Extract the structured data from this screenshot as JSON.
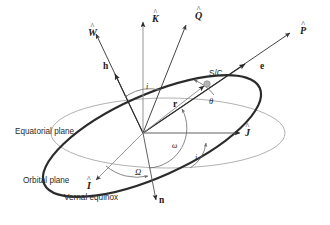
{
  "figure": {
    "colors": {
      "orbit_plane_stroke": "#2b2b2b",
      "equatorial_plane_stroke": "#a8a8a8",
      "vector_stroke": "#3a3a3a",
      "arc_stroke": "#6a6a6a",
      "spacecraft_fill": "#b0b0b0",
      "text": "#2b2b2b",
      "background": "#ffffff"
    }
  },
  "planes": [
    {
      "id": "equatorial-plane",
      "label": "Equatorial plane",
      "style": "thin-light-gray-ellipse"
    },
    {
      "id": "orbital-plane",
      "label": "Orbital plane",
      "style": "thick-dark-ellipse"
    }
  ],
  "labels": {
    "equatorial_plane": "Equatorial plane",
    "orbital_plane": "Orbital plane",
    "vernal_equinox": "Vernal equinox",
    "spacecraft": "S/C"
  },
  "vectors": [
    {
      "id": "W-hat",
      "base": "W",
      "accent": "hat",
      "kind": "unit",
      "description": "orbit normal unit vector"
    },
    {
      "id": "K-hat",
      "base": "K",
      "accent": "hat",
      "kind": "unit",
      "description": "inertial Z unit vector"
    },
    {
      "id": "Q-hat",
      "base": "Q",
      "accent": "hat",
      "kind": "unit",
      "description": "perifocal semi-latus direction"
    },
    {
      "id": "P-hat",
      "base": "P",
      "accent": "hat",
      "kind": "unit",
      "description": "perifocal perigee direction"
    },
    {
      "id": "I-hat",
      "base": "I",
      "accent": "hat",
      "kind": "unit",
      "description": "inertial X unit vector toward vernal equinox"
    },
    {
      "id": "J-hat",
      "base": "J",
      "accent": "hat",
      "kind": "unit",
      "description": "inertial Y unit vector"
    },
    {
      "id": "h",
      "base": "h",
      "accent": "none",
      "kind": "bold",
      "description": "specific angular momentum vector"
    },
    {
      "id": "e",
      "base": "e",
      "accent": "none",
      "kind": "bold",
      "description": "eccentricity vector"
    },
    {
      "id": "n",
      "base": "n",
      "accent": "none",
      "kind": "bold",
      "description": "ascending node vector"
    },
    {
      "id": "r",
      "base": "r",
      "accent": "none",
      "kind": "bold",
      "description": "position vector to spacecraft"
    }
  ],
  "angles": [
    {
      "id": "inclination-upper",
      "symbol": "i",
      "name": "inclination between h and K-hat"
    },
    {
      "id": "inclination-lower",
      "symbol": "i",
      "name": "inclination between equatorial and orbital plane"
    },
    {
      "id": "raan",
      "symbol": "Ω",
      "name": "right ascension of the ascending node"
    },
    {
      "id": "arg-perigee",
      "symbol": "ω",
      "name": "argument of perigee"
    },
    {
      "id": "true-anomaly",
      "symbol": "θ",
      "name": "true anomaly"
    }
  ]
}
